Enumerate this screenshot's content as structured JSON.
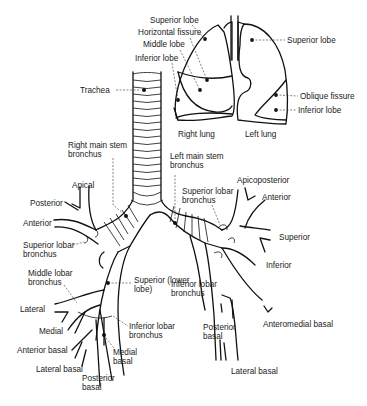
{
  "diagram": {
    "lungs": {
      "right_lung_label": "Right lung",
      "left_lung_label": "Left lung",
      "right": {
        "superior_lobe": "Superior lobe",
        "horizontal_fissure": "Horizontal fissure",
        "middle_lobe": "Middle lobe",
        "inferior_lobe": "Inferior lobe"
      },
      "left": {
        "superior_lobe": "Superior lobe",
        "oblique_fissure": "Oblique fissure",
        "inferior_lobe": "Inferior lobe"
      }
    },
    "airway": {
      "trachea": "Trachea",
      "right_main_stem_1": "Right main stem",
      "right_main_stem_2": "bronchus",
      "left_main_stem_1": "Left main stem",
      "left_main_stem_2": "bronchus"
    },
    "right_side": {
      "apical": "Apical",
      "posterior": "Posterior",
      "anterior": "Anterior",
      "superior_lobar_1": "Superior lobar",
      "superior_lobar_2": "bronchus",
      "middle_lobar_1": "Middle lobar",
      "middle_lobar_2": "bronchus",
      "superior_lower_1": "Superior (lower",
      "superior_lower_2": "lobe)",
      "lateral": "Lateral",
      "medial": "Medial",
      "anterior_basal": "Anterior basal",
      "lateral_basal": "Lateral basal",
      "posterior_basal_1": "Posterior",
      "posterior_basal_2": "basal",
      "medial_basal_1": "Medial",
      "medial_basal_2": "basal",
      "inferior_lobar_1": "Inferior lobar",
      "inferior_lobar_2": "bronchus"
    },
    "left_side": {
      "superior_lobar_1": "Superior lobar",
      "superior_lobar_2": "bronchus",
      "apicoposterior": "Apicoposterior",
      "anterior": "Anterior",
      "superior": "Superior",
      "inferior": "Inferior",
      "inferior_lobar_1": "Inferior lobar",
      "inferior_lobar_2": "bronchus",
      "posterior_basal_1": "Posterior",
      "posterior_basal_2": "basal",
      "anteromedial_basal": "Anteromedial basal",
      "lateral_basal": "Lateral basal"
    }
  }
}
